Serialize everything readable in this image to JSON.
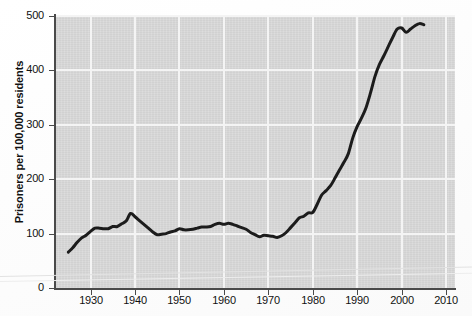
{
  "figure": {
    "background_color": "#fdfdfd",
    "plot_background_color": "#d9d9d9",
    "gridline_color": "#f4f4f4",
    "axis_color": "#4a4a4a",
    "line_color": "#1c1c1c"
  },
  "axes": {
    "y_title": "Prisoners per 100,000 residents",
    "y_ticks": [
      "0",
      "100",
      "200",
      "300",
      "400",
      "500"
    ],
    "x_ticks": [
      "1930",
      "1940",
      "1950",
      "1960",
      "1970",
      "1980",
      "1990",
      "2000",
      "2010"
    ]
  },
  "chart_data": {
    "type": "line",
    "title": "",
    "subtitle": "",
    "xlabel": "",
    "ylabel": "Prisoners per 100,000 residents",
    "xlim": [
      1922,
      2012
    ],
    "ylim": [
      0,
      500
    ],
    "xtick_values": [
      1930,
      1940,
      1950,
      1960,
      1970,
      1980,
      1990,
      2000,
      2010
    ],
    "xtick_labels": [
      "1930",
      "1940",
      "1950",
      "1960",
      "1970",
      "1980",
      "1990",
      "2000",
      "2010"
    ],
    "ytick_values": [
      0,
      100,
      200,
      300,
      400,
      500
    ],
    "ytick_labels": [
      "0",
      "100",
      "200",
      "300",
      "400",
      "500"
    ],
    "grid": true,
    "grid_axis": "both",
    "legend": false,
    "legend_position": "none",
    "annotations": [],
    "series": [
      {
        "name": "Prisoners per 100,000 residents",
        "color": "#1c1c1c",
        "line_width": 3,
        "x": [
          1925,
          1926,
          1927,
          1928,
          1929,
          1930,
          1931,
          1932,
          1933,
          1934,
          1935,
          1936,
          1937,
          1938,
          1939,
          1940,
          1941,
          1942,
          1943,
          1944,
          1945,
          1946,
          1947,
          1948,
          1949,
          1950,
          1951,
          1952,
          1953,
          1954,
          1955,
          1956,
          1957,
          1958,
          1959,
          1960,
          1961,
          1962,
          1963,
          1964,
          1965,
          1966,
          1967,
          1968,
          1969,
          1970,
          1971,
          1972,
          1973,
          1974,
          1975,
          1976,
          1977,
          1978,
          1979,
          1980,
          1981,
          1982,
          1983,
          1984,
          1985,
          1986,
          1987,
          1988,
          1989,
          1990,
          1991,
          1992,
          1993,
          1994,
          1995,
          1996,
          1997,
          1998,
          1999,
          2000,
          2001,
          2002,
          2003,
          2004,
          2005
        ],
        "y": [
          66,
          74,
          84,
          92,
          97,
          104,
          110,
          110,
          109,
          109,
          113,
          113,
          118,
          123,
          137,
          131,
          124,
          117,
          110,
          103,
          98,
          99,
          100,
          103,
          105,
          109,
          107,
          107,
          108,
          110,
          112,
          112,
          113,
          117,
          119,
          117,
          119,
          117,
          114,
          111,
          108,
          102,
          98,
          94,
          97,
          96,
          95,
          93,
          96,
          102,
          111,
          120,
          129,
          132,
          138,
          139,
          154,
          171,
          179,
          188,
          202,
          217,
          231,
          247,
          276,
          297,
          313,
          332,
          359,
          389,
          411,
          427,
          444,
          461,
          476,
          478,
          470,
          476,
          482,
          486,
          484
        ]
      }
    ]
  }
}
